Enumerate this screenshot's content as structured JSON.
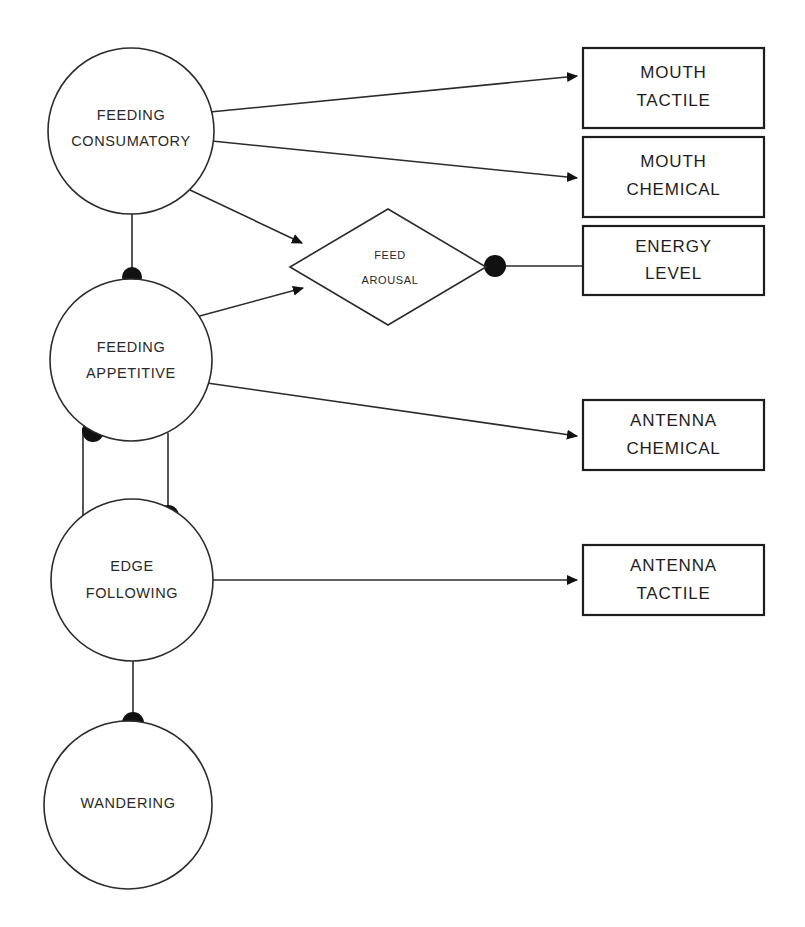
{
  "diagram": {
    "background_color": "#ffffff",
    "stroke_color": "#2b2b2b",
    "dot_color": "#111111",
    "behavior_nodes": [
      {
        "id": "feeding-consumatory",
        "shape": "circle",
        "line1": "FEEDING",
        "line2": "CONSUMATORY",
        "cx": 131,
        "cy": 131,
        "r": 83
      },
      {
        "id": "feeding-appetitive",
        "shape": "circle",
        "line1": "FEEDING",
        "line2": "APPETITIVE",
        "cx": 131,
        "cy": 360,
        "r": 81
      },
      {
        "id": "edge-following",
        "shape": "circle",
        "line1": "EDGE",
        "line2": "FOLLOWING",
        "cx": 132,
        "cy": 580,
        "r": 81
      },
      {
        "id": "wandering",
        "shape": "circle",
        "line1": "WANDERING",
        "line2": "",
        "cx": 128,
        "cy": 805,
        "r": 84
      }
    ],
    "arousal_node": {
      "id": "feed-arousal",
      "shape": "diamond",
      "line1": "FEED",
      "line2": "AROUSAL",
      "cx": 388,
      "cy": 267,
      "half_width": 98,
      "half_height": 58
    },
    "sensor_boxes": [
      {
        "id": "mouth-tactile",
        "line1": "MOUTH",
        "line2": "TACTILE",
        "x": 583,
        "y": 48,
        "width": 181,
        "height": 80
      },
      {
        "id": "mouth-chemical",
        "line1": "MOUTH",
        "line2": "CHEMICAL",
        "x": 583,
        "y": 137,
        "width": 181,
        "height": 80
      },
      {
        "id": "energy-level",
        "line1": "ENERGY",
        "line2": "LEVEL",
        "x": 583,
        "y": 226,
        "width": 181,
        "height": 69
      },
      {
        "id": "antenna-chemical",
        "line1": "ANTENNA",
        "line2": "CHEMICAL",
        "x": 583,
        "y": 400,
        "width": 181,
        "height": 70
      },
      {
        "id": "antenna-tactile",
        "line1": "ANTENNA",
        "line2": "TACTILE",
        "x": 583,
        "y": 545,
        "width": 181,
        "height": 70
      }
    ],
    "connections": [
      {
        "id": "consumatory-to-mouth-tactile",
        "from": "feeding-consumatory",
        "to": "mouth-tactile",
        "style": "arrow"
      },
      {
        "id": "consumatory-to-mouth-chemical",
        "from": "feeding-consumatory",
        "to": "mouth-chemical",
        "style": "arrow"
      },
      {
        "id": "consumatory-to-feed-arousal",
        "from": "feeding-consumatory",
        "to": "feed-arousal",
        "style": "arrow"
      },
      {
        "id": "appetitive-to-feed-arousal",
        "from": "feeding-appetitive",
        "to": "feed-arousal",
        "style": "arrow"
      },
      {
        "id": "feed-arousal-to-energy-level",
        "from": "feed-arousal",
        "to": "energy-level",
        "style": "dot-line"
      },
      {
        "id": "appetitive-to-antenna-chemical",
        "from": "feeding-appetitive",
        "to": "antenna-chemical",
        "style": "arrow"
      },
      {
        "id": "edge-following-to-antenna-tactile",
        "from": "edge-following",
        "to": "antenna-tactile",
        "style": "arrow"
      },
      {
        "id": "consumatory-suppresses-appetitive",
        "from": "feeding-consumatory",
        "to": "feeding-appetitive",
        "style": "dot-line"
      },
      {
        "id": "appetitive-suppresses-edge-following-left",
        "from": "feeding-appetitive",
        "to": "edge-following",
        "style": "dot-line"
      },
      {
        "id": "appetitive-suppresses-edge-following-right",
        "from": "feeding-appetitive",
        "to": "edge-following",
        "style": "dot-line"
      },
      {
        "id": "edge-following-suppresses-wandering",
        "from": "edge-following",
        "to": "wandering",
        "style": "dot-line"
      }
    ]
  }
}
